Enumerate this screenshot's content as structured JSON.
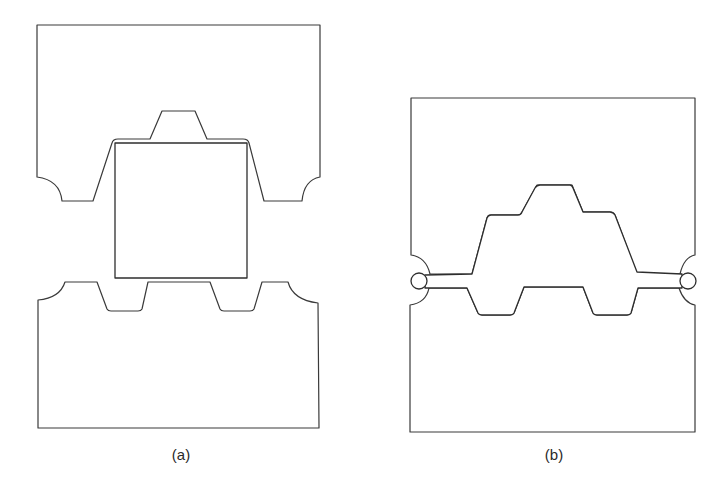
{
  "figure": {
    "panels": [
      {
        "id": "a",
        "label": "(a)",
        "description": "Open closed-die forging setup before forging: upper and lower dies with cavity, rectangular billet (hatched) placed between them"
      },
      {
        "id": "b",
        "label": "(b)",
        "description": "Closed dies after forging: billet has filled the cavity and excess metal forms flash at the parting line"
      }
    ],
    "colors": {
      "line": "#333333",
      "background": "#ffffff"
    }
  }
}
